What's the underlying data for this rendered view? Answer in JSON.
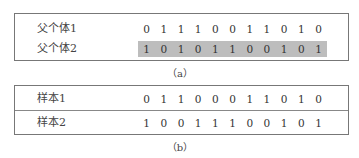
{
  "figure_a": {
    "caption": "（a）",
    "rows": [
      {
        "label": "父个体1",
        "bits": [
          "0",
          "1",
          "1",
          "1",
          "0",
          "0",
          "1",
          "1",
          "0",
          "1",
          "0"
        ],
        "shaded": false
      },
      {
        "label": "父个体2",
        "bits": [
          "1",
          "0",
          "1",
          "0",
          "1",
          "1",
          "0",
          "0",
          "1",
          "0",
          "1"
        ],
        "shaded": true
      }
    ],
    "shade_color": "#bdbdbd"
  },
  "figure_b": {
    "caption": "（b）",
    "rows": [
      {
        "label": "样本1",
        "bits": [
          "0",
          "1",
          "1",
          "0",
          "0",
          "0",
          "1",
          "1",
          "0",
          "1",
          "0"
        ]
      },
      {
        "label": "样本2",
        "bits": [
          "1",
          "0",
          "0",
          "1",
          "1",
          "1",
          "0",
          "0",
          "1",
          "0",
          "1"
        ]
      }
    ]
  }
}
